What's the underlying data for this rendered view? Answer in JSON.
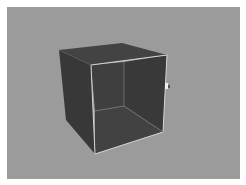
{
  "viewport": {
    "background_color": "#9b9b9b",
    "object": "open-front-cube",
    "colors": {
      "top_face": "#404040",
      "left_face": "#383838",
      "back_face": "#3d3d3d",
      "right_inner_face": "#3a3a3a",
      "bottom_inner_face": "#424242",
      "edge_highlight": "#d8d8d8"
    }
  },
  "cursor": {
    "icon": "pointer-cursor-icon"
  }
}
